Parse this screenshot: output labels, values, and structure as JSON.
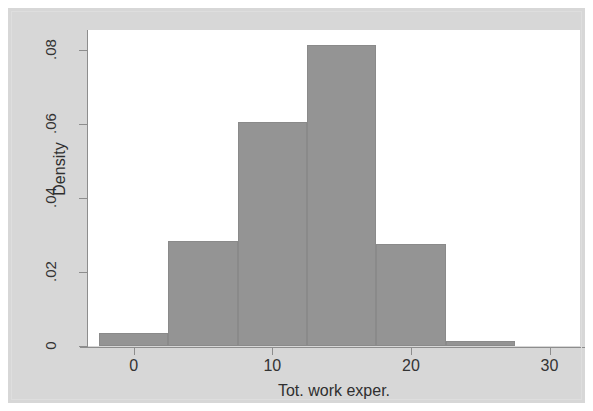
{
  "figure": {
    "background_color": "#d7d7d7",
    "plot_background_color": "#ffffff",
    "bar_color": "#949494",
    "axis_color": "#8d8d8d"
  },
  "chart_data": {
    "type": "bar",
    "chart_subtype": "histogram",
    "title": "",
    "subtitle": "",
    "xlabel": "Tot. work exper.",
    "ylabel": "Density",
    "xlim": [
      -3.3,
      32.2
    ],
    "ylim": [
      0,
      0.0855
    ],
    "grid": false,
    "legend": false,
    "x_ticks": [
      0,
      10,
      20,
      30
    ],
    "x_tick_labels": [
      "0",
      "10",
      "20",
      "30"
    ],
    "y_ticks": [
      0,
      0.02,
      0.04,
      0.06,
      0.08
    ],
    "y_tick_labels": [
      "0",
      ".02",
      ".04",
      ".06",
      ".08"
    ],
    "bin_edges": [
      -2.5,
      2.5,
      7.5,
      12.5,
      17.5,
      22.5,
      27.5
    ],
    "bin_centers": [
      0,
      5,
      10,
      15,
      20,
      25
    ],
    "values": [
      0.0035,
      0.0285,
      0.0605,
      0.0815,
      0.0275,
      0.0013
    ],
    "categories": [
      "-2.5 to 2.5",
      "2.5 to 7.5",
      "7.5 to 12.5",
      "12.5 to 17.5",
      "17.5 to 22.5",
      "22.5 to 27.5"
    ],
    "bars": [
      {
        "x0": -2.5,
        "x1": 2.5,
        "density": 0.0035
      },
      {
        "x0": 2.5,
        "x1": 7.5,
        "density": 0.0285
      },
      {
        "x0": 7.5,
        "x1": 12.5,
        "density": 0.0605
      },
      {
        "x0": 12.5,
        "x1": 17.5,
        "density": 0.0815
      },
      {
        "x0": 17.5,
        "x1": 22.5,
        "density": 0.0275
      },
      {
        "x0": 22.5,
        "x1": 27.5,
        "density": 0.0013
      }
    ]
  },
  "axes": {
    "y_title": "Density",
    "x_title": "Tot. work exper.",
    "y_labels": [
      "0",
      ".02",
      ".04",
      ".06",
      ".08"
    ],
    "x_labels": [
      "0",
      "10",
      "20",
      "30"
    ]
  }
}
